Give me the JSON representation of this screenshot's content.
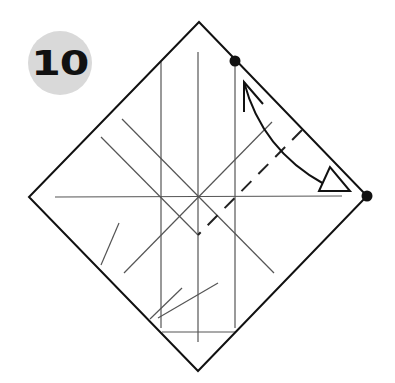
{
  "step": {
    "number": "10",
    "badge_color": "#d9d9d9"
  },
  "diagram": {
    "type": "origami-fold-instruction",
    "square": {
      "top": [
        199,
        22
      ],
      "right": [
        367,
        196
      ],
      "bottom": [
        198,
        371
      ],
      "left": [
        29,
        197
      ]
    },
    "reference_dots": [
      [
        235,
        61
      ],
      [
        367,
        196
      ]
    ],
    "fold": "valley-fold",
    "arrow": "fold-and-unfold",
    "colors": {
      "outline": "#111111",
      "crease": "#555555",
      "dot": "#111111"
    }
  }
}
